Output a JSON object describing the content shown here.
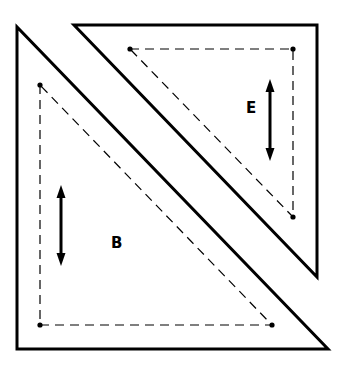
{
  "diagram": {
    "pieces": [
      {
        "label": "B",
        "shape": "right-triangle",
        "outer": [
          [
            17,
            27
          ],
          [
            17,
            349
          ],
          [
            328,
            349
          ]
        ],
        "seam": [
          [
            40,
            85
          ],
          [
            40,
            325
          ],
          [
            272,
            325
          ]
        ],
        "grain_arrow": {
          "x": 61,
          "y1": 185,
          "y2": 266,
          "direction": "vertical"
        },
        "label_pos": [
          116,
          248
        ]
      },
      {
        "label": "E",
        "shape": "right-triangle",
        "outer": [
          [
            74,
            25
          ],
          [
            317,
            25
          ],
          [
            317,
            277
          ]
        ],
        "seam": [
          [
            130,
            49
          ],
          [
            293,
            49
          ],
          [
            293,
            217
          ]
        ],
        "grain_arrow": {
          "x": 270,
          "y1": 79,
          "y2": 161,
          "direction": "vertical"
        },
        "label_pos": [
          251,
          113
        ]
      }
    ],
    "colors": {
      "line": "#000000",
      "background": "#ffffff"
    }
  }
}
